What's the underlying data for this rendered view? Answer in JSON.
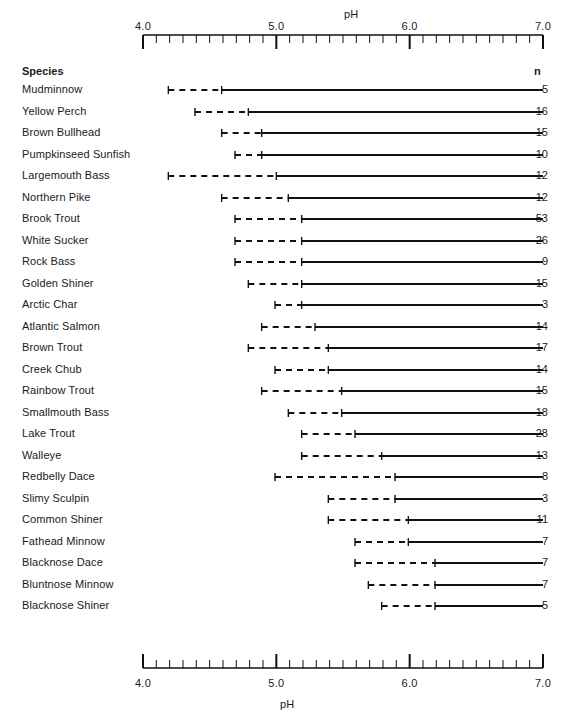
{
  "axis": {
    "title_top": "pH",
    "title_bottom": "pH",
    "n_header": "n",
    "species_header": "Species",
    "tick_labels": [
      "4.0",
      "5.0",
      "6.0",
      "7.0"
    ],
    "tick_values": [
      4.0,
      5.0,
      6.0,
      7.0
    ],
    "min": 4.0,
    "max": 7.0,
    "minor_step": 0.1
  },
  "bottom_caption": "",
  "chart_data": {
    "type": "range",
    "title": "",
    "xlabel": "pH",
    "ylabel": "Species",
    "xlim": [
      4.0,
      7.0
    ],
    "grid": false,
    "legend": "",
    "columns": [
      "Species",
      "dash_start_pH",
      "solid_start_pH",
      "end_pH",
      "n"
    ],
    "rows": [
      {
        "species": "Mudminnow",
        "dash_start": 4.19,
        "solid_start": 4.59,
        "end": 7.0,
        "n": 5
      },
      {
        "species": "Yellow Perch",
        "dash_start": 4.39,
        "solid_start": 4.79,
        "end": 7.0,
        "n": 16
      },
      {
        "species": "Brown Bullhead",
        "dash_start": 4.59,
        "solid_start": 4.89,
        "end": 7.0,
        "n": 15
      },
      {
        "species": "Pumpkinseed Sunfish",
        "dash_start": 4.69,
        "solid_start": 4.89,
        "end": 7.0,
        "n": 10
      },
      {
        "species": "Largemouth Bass",
        "dash_start": 4.19,
        "solid_start": 5.0,
        "end": 7.0,
        "n": 12
      },
      {
        "species": "Northern Pike",
        "dash_start": 4.59,
        "solid_start": 5.09,
        "end": 7.0,
        "n": 12
      },
      {
        "species": "Brook Trout",
        "dash_start": 4.69,
        "solid_start": 5.19,
        "end": 7.0,
        "n": 53
      },
      {
        "species": "White Sucker",
        "dash_start": 4.69,
        "solid_start": 5.19,
        "end": 7.0,
        "n": 26
      },
      {
        "species": "Rock Bass",
        "dash_start": 4.69,
        "solid_start": 5.19,
        "end": 7.0,
        "n": 9
      },
      {
        "species": "Golden Shiner",
        "dash_start": 4.79,
        "solid_start": 5.19,
        "end": 7.0,
        "n": 15
      },
      {
        "species": "Arctic Char",
        "dash_start": 4.99,
        "solid_start": 5.19,
        "end": 7.0,
        "n": 3
      },
      {
        "species": "Atlantic Salmon",
        "dash_start": 4.89,
        "solid_start": 5.29,
        "end": 7.0,
        "n": 14
      },
      {
        "species": "Brown Trout",
        "dash_start": 4.79,
        "solid_start": 5.39,
        "end": 7.0,
        "n": 17
      },
      {
        "species": "Creek Chub",
        "dash_start": 4.99,
        "solid_start": 5.39,
        "end": 7.0,
        "n": 14
      },
      {
        "species": "Rainbow Trout",
        "dash_start": 4.89,
        "solid_start": 5.49,
        "end": 7.0,
        "n": 15
      },
      {
        "species": "Smallmouth Bass",
        "dash_start": 5.09,
        "solid_start": 5.49,
        "end": 7.0,
        "n": 18
      },
      {
        "species": "Lake Trout",
        "dash_start": 5.19,
        "solid_start": 5.59,
        "end": 7.0,
        "n": 28
      },
      {
        "species": "Walleye",
        "dash_start": 5.19,
        "solid_start": 5.79,
        "end": 7.0,
        "n": 13
      },
      {
        "species": "Redbelly Dace",
        "dash_start": 4.99,
        "solid_start": 5.89,
        "end": 7.0,
        "n": 8
      },
      {
        "species": "Slimy Sculpin",
        "dash_start": 5.39,
        "solid_start": 5.89,
        "end": 7.0,
        "n": 3
      },
      {
        "species": "Common Shiner",
        "dash_start": 5.39,
        "solid_start": 5.99,
        "end": 7.0,
        "n": 11
      },
      {
        "species": "Fathead Minnow",
        "dash_start": 5.59,
        "solid_start": 5.99,
        "end": 7.0,
        "n": 7
      },
      {
        "species": "Blacknose Dace",
        "dash_start": 5.59,
        "solid_start": 6.19,
        "end": 7.0,
        "n": 7
      },
      {
        "species": "Bluntnose Minnow",
        "dash_start": 5.69,
        "solid_start": 6.19,
        "end": 7.0,
        "n": 7
      },
      {
        "species": "Blacknose Shiner",
        "dash_start": 5.79,
        "solid_start": 6.19,
        "end": 7.0,
        "n": 5
      }
    ]
  }
}
